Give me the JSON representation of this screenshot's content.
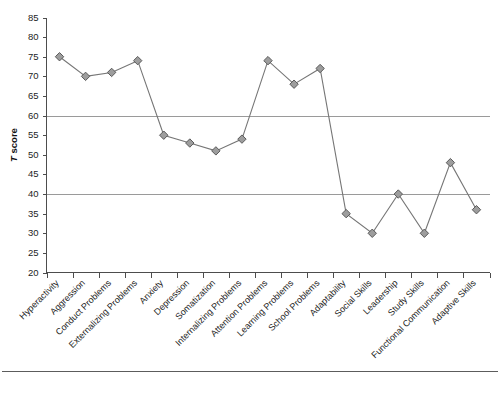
{
  "chart_data": {
    "type": "line",
    "title": "",
    "xlabel": "",
    "ylabel": "T score",
    "ylabel_italic_prefix": "T",
    "ylabel_rest": " score",
    "ylim": [
      20,
      85
    ],
    "ytick_step": 5,
    "yticks": [
      20,
      25,
      30,
      35,
      40,
      45,
      50,
      55,
      60,
      65,
      70,
      75,
      80,
      85
    ],
    "ytick_labels": [
      "20",
      "25",
      "30",
      "35",
      "40",
      "45",
      "50",
      "55",
      "60",
      "65",
      "70",
      "75",
      "80",
      "85"
    ],
    "gridlines": [
      40,
      60
    ],
    "grid": "horizontal-at-40-and-60",
    "legend": "none",
    "marker": "diamond",
    "marker_fill": "#9d9d9d",
    "marker_stroke": "#5a5a5a",
    "line_color": "#767676",
    "categories": [
      "Hyperactivity",
      "Aggression",
      "Conduct Problems",
      "Externalizing Problems",
      "Anxiety",
      "Depression",
      "Somatization",
      "Internalizing Problems",
      "Attention Problems",
      "Learning Problems",
      "School Problems",
      "Adaptability",
      "Social Skills",
      "Leadership",
      "Study Skills",
      "Functional Communication",
      "Adaptive Skills"
    ],
    "values": [
      75,
      70,
      71,
      74,
      55,
      53,
      51,
      54,
      74,
      68,
      72,
      35,
      30,
      40,
      30,
      48,
      36
    ],
    "points": [
      {
        "label": "Hyperactivity",
        "value": 75
      },
      {
        "label": "Aggression",
        "value": 70
      },
      {
        "label": "Conduct Problems",
        "value": 71
      },
      {
        "label": "Externalizing Problems",
        "value": 74
      },
      {
        "label": "Anxiety",
        "value": 55
      },
      {
        "label": "Depression",
        "value": 53
      },
      {
        "label": "Somatization",
        "value": 51
      },
      {
        "label": "Internalizing Problems",
        "value": 54
      },
      {
        "label": "Attention Problems",
        "value": 74
      },
      {
        "label": "Learning Problems",
        "value": 68
      },
      {
        "label": "School Problems",
        "value": 72
      },
      {
        "label": "Adaptability",
        "value": 35
      },
      {
        "label": "Social Skills",
        "value": 30
      },
      {
        "label": "Leadership",
        "value": 40
      },
      {
        "label": "Study Skills",
        "value": 30
      },
      {
        "label": "Functional Communication",
        "value": 48
      },
      {
        "label": "Adaptive Skills",
        "value": 36
      }
    ]
  }
}
